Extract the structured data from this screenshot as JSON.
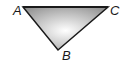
{
  "diagram": {
    "type": "triangle",
    "vertices": [
      {
        "name": "A",
        "x": 23,
        "y": 7,
        "label_x": 13,
        "label_y": 15
      },
      {
        "name": "C",
        "x": 108,
        "y": 7,
        "label_x": 110,
        "label_y": 15
      },
      {
        "name": "B",
        "x": 58,
        "y": 50,
        "label_x": 62,
        "label_y": 60
      }
    ],
    "fill_gradient": {
      "top": "#9a9a9a",
      "bottom": "#ffffff"
    },
    "stroke": "#1a1a1a"
  }
}
